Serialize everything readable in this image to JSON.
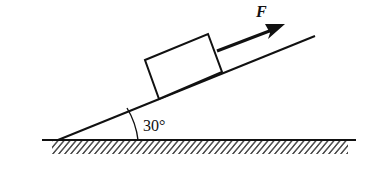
{
  "diagram": {
    "force_label": "F",
    "angle_label": "30°",
    "incline_angle_deg": 30,
    "colors": {
      "stroke": "#111111",
      "background": "#ffffff"
    },
    "elements": [
      {
        "name": "ground",
        "type": "hatched-surface"
      },
      {
        "name": "incline",
        "type": "line"
      },
      {
        "name": "block",
        "type": "rectangle"
      },
      {
        "name": "force-arrow",
        "type": "arrow",
        "direction": "up-the-incline"
      },
      {
        "name": "angle-arc",
        "type": "arc"
      }
    ]
  }
}
